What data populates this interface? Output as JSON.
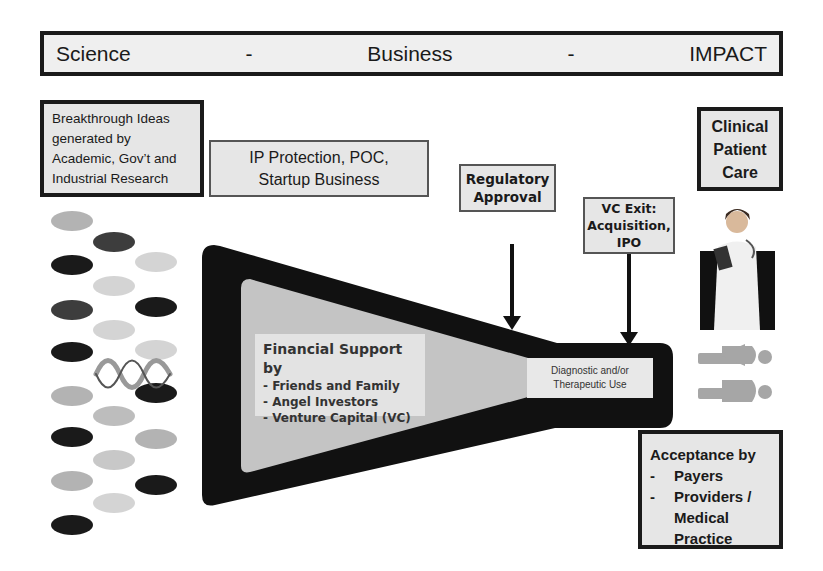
{
  "header": {
    "left": "Science",
    "sep1": "-",
    "center": "Business",
    "sep2": "-",
    "right": "IMPACT"
  },
  "boxes": {
    "breakthrough": {
      "lines": [
        "Breakthrough Ideas",
        "generated by",
        "Academic, Gov’t and",
        "Industrial Research"
      ]
    },
    "ip": {
      "lines": [
        "IP Protection, POC,",
        "Startup Business"
      ]
    },
    "regulatory": {
      "lines": [
        "Regulatory",
        "Approval"
      ]
    },
    "vc_exit": {
      "lines": [
        "VC Exit:",
        "Acquisition,",
        "IPO"
      ]
    },
    "clinical": {
      "lines": [
        "Clinical",
        "Patient",
        "Care"
      ]
    },
    "acceptance": {
      "title": "Acceptance by",
      "items": [
        {
          "dash": "-",
          "label": "Payers"
        },
        {
          "dash": "-",
          "label": "Providers /"
        },
        {
          "dash": "",
          "label": "Medical"
        },
        {
          "dash": "",
          "label": "Practice"
        }
      ]
    }
  },
  "funnel": {
    "financial": {
      "title": "Financial Support by",
      "items": [
        "- Friends and Family",
        "- Angel Investors",
        "- Venture Capital (VC)"
      ]
    },
    "output": {
      "lines": [
        "Diagnostic and/or",
        "Therapeutic Use"
      ]
    }
  },
  "icons": {
    "dna": "dna-helix-icon",
    "doctor": "doctor-icon",
    "patients": "patients-icon"
  },
  "colors": {
    "dark": "#1a1a1a",
    "mid": "#4a4a4a",
    "light": "#c8c8c8",
    "lighter": "#d9d9d9",
    "box_fill": "#e6e6e6",
    "funnel_inner": "#c4c4c4",
    "person": "#a6a6a6"
  }
}
